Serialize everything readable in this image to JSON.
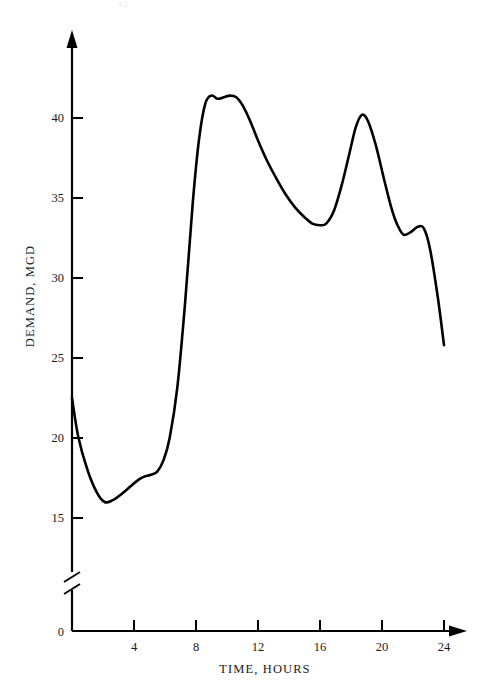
{
  "page": {
    "number": "42",
    "background": "#ffffff",
    "ink": "#111111"
  },
  "chart_data": {
    "type": "line",
    "title": "",
    "subtitle": "",
    "xlabel": "TIME, HOURS",
    "ylabel": "DEMAND, MGD",
    "xlim": [
      0,
      25
    ],
    "ylim": [
      0,
      43
    ],
    "y_axis_break": true,
    "y_break_between": [
      0,
      13.5
    ],
    "grid": false,
    "legend": null,
    "legend_position": "none",
    "line_color": "#000000",
    "line_width": 2.6,
    "axis_color": "#000000",
    "x_ticks": [
      4,
      8,
      12,
      16,
      20,
      24
    ],
    "x_tick_labels": [
      "4",
      "8",
      "12",
      "16",
      "20",
      "24"
    ],
    "y_ticks": [
      15,
      20,
      25,
      30,
      35,
      40
    ],
    "y_tick_labels": [
      "15",
      "20",
      "25",
      "30",
      "35",
      "40"
    ],
    "y_origin_label": "0",
    "x": [
      0,
      0.4,
      1,
      1.6,
      2.1,
      2.6,
      3.2,
      3.8,
      4.3,
      4.7,
      5.1,
      5.5,
      5.9,
      6.3,
      6.8,
      7.3,
      7.8,
      8.2,
      8.6,
      9.0,
      9.4,
      9.8,
      10.2,
      10.6,
      11.0,
      11.5,
      12.0,
      12.6,
      13.2,
      13.8,
      14.4,
      15.0,
      15.5,
      16.0,
      16.4,
      16.9,
      17.4,
      17.9,
      18.3,
      18.7,
      19.1,
      19.6,
      20.1,
      20.6,
      21.0,
      21.4,
      21.9,
      22.3,
      22.7,
      23.1,
      23.6,
      24.0
    ],
    "y": [
      22.5,
      20.1,
      18.0,
      16.6,
      16.0,
      16.1,
      16.5,
      17.0,
      17.4,
      17.6,
      17.7,
      17.9,
      18.6,
      20.0,
      23.2,
      28.5,
      34.8,
      38.7,
      40.9,
      41.4,
      41.2,
      41.3,
      41.4,
      41.3,
      40.8,
      39.8,
      38.6,
      37.3,
      36.2,
      35.2,
      34.4,
      33.8,
      33.4,
      33.3,
      33.4,
      34.2,
      35.8,
      37.8,
      39.4,
      40.2,
      39.8,
      38.3,
      36.3,
      34.4,
      33.3,
      32.7,
      32.9,
      33.2,
      33.1,
      31.8,
      28.8,
      25.8
    ],
    "annotations": [
      {
        "label": "daily minimum demand",
        "x": 2.1,
        "y": 16.0
      },
      {
        "label": "morning peak plateau",
        "x": 9.8,
        "y": 41.4
      },
      {
        "label": "afternoon trough",
        "x": 16.0,
        "y": 33.3
      },
      {
        "label": "evening peak",
        "x": 18.7,
        "y": 40.2
      },
      {
        "label": "late evening bump",
        "x": 22.3,
        "y": 33.2
      },
      {
        "label": "end of day",
        "x": 24.0,
        "y": 25.8
      }
    ]
  }
}
